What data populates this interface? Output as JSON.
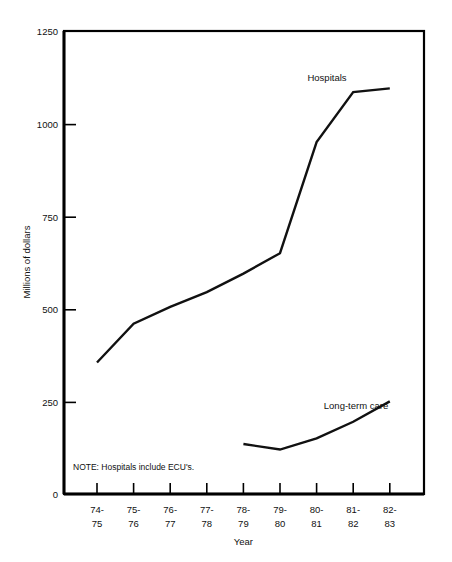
{
  "chart_data": {
    "type": "line",
    "title": "",
    "xlabel": "Year",
    "ylabel": "Millions of dollars",
    "categories": [
      "74-\n75",
      "75-\n76",
      "76-\n77",
      "77-\n78",
      "78-\n79",
      "79-\n80",
      "80-\n81",
      "81-\n82",
      "82-\n83"
    ],
    "categories_top": [
      "74-",
      "75-",
      "76-",
      "77-",
      "78-",
      "79-",
      "80-",
      "81-",
      "82-"
    ],
    "categories_bottom": [
      "75",
      "76",
      "77",
      "78",
      "79",
      "80",
      "81",
      "82",
      "83"
    ],
    "ylim": [
      0,
      1250
    ],
    "ytick_labels": [
      "1250",
      "1000",
      "750",
      "500",
      "250",
      "0"
    ],
    "ytick_values": [
      1250,
      1000,
      750,
      500,
      250,
      0
    ],
    "grid": false,
    "legend_position": "inline-annotation",
    "series": [
      {
        "name": "Hospitals",
        "label": "Hospitals",
        "x": [
          "74-75",
          "75-76",
          "76-77",
          "77-78",
          "78-79",
          "79-80",
          "80-81",
          "81-82",
          "82-83"
        ],
        "values": [
          355,
          460,
          505,
          545,
          595,
          650,
          950,
          1085,
          1095
        ]
      },
      {
        "name": "Long-term care",
        "label": "Long-term care",
        "x": [
          "78-79",
          "79-80",
          "80-81",
          "81-82",
          "82-83"
        ],
        "values": [
          135,
          120,
          150,
          195,
          250
        ]
      }
    ],
    "annotations": [
      {
        "name": "note",
        "text": "NOTE: Hospitals include ECU's."
      }
    ]
  },
  "axes": {
    "y_title": "Millions of dollars",
    "x_title": "Year"
  },
  "note": {
    "text": "NOTE: Hospitals include ECU's."
  },
  "labels": {
    "hospitals": "Hospitals",
    "long_term_care": "Long-term care"
  },
  "yticks": {
    "t0": "1250",
    "t1": "1000",
    "t2": "750",
    "t3": "500",
    "t4": "250",
    "t5": "0"
  },
  "xticks": {
    "c0_top": "74-",
    "c0_bottom": "75",
    "c1_top": "75-",
    "c1_bottom": "76",
    "c2_top": "76-",
    "c2_bottom": "77",
    "c3_top": "77-",
    "c3_bottom": "78",
    "c4_top": "78-",
    "c4_bottom": "79",
    "c5_top": "79-",
    "c5_bottom": "80",
    "c6_top": "80-",
    "c6_bottom": "81",
    "c7_top": "81-",
    "c7_bottom": "82",
    "c8_top": "82-",
    "c8_bottom": "83"
  },
  "colors": {
    "line": "#111111",
    "axis": "#000000",
    "background": "#ffffff"
  }
}
